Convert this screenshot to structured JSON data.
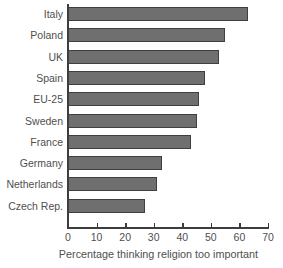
{
  "chart_data": {
    "type": "bar",
    "orientation": "horizontal",
    "title": "",
    "subtitle": "",
    "xlabel": "Percentage thinking religion too important",
    "ylabel": "",
    "categories": [
      "Italy",
      "Poland",
      "UK",
      "Spain",
      "EU-25",
      "Sweden",
      "France",
      "Germany",
      "Netherlands",
      "Czech Rep."
    ],
    "values": [
      63,
      55,
      53,
      48,
      46,
      45,
      43,
      33,
      31,
      27
    ],
    "xlim": [
      0,
      70
    ],
    "xticks": [
      0,
      10,
      20,
      30,
      40,
      50,
      60,
      70
    ],
    "xtick_labels": [
      "0",
      "10",
      "20",
      "30",
      "40",
      "50",
      "60",
      "70"
    ],
    "grid": false,
    "legend": null,
    "bar_color": "#6f6f6f",
    "bar_edge_color": "#3f3f3f",
    "axis_color": "#3d3d3d",
    "text_color": "#4f4f4f",
    "background": "#ffffff"
  }
}
